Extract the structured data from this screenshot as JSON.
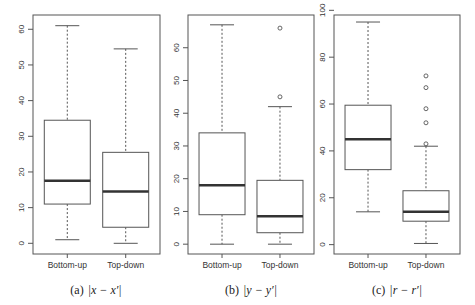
{
  "chart_data": [
    {
      "type": "boxplot",
      "caption_prefix": "(a)",
      "caption_math": "|x − x′|",
      "categories": [
        "Bottom-up",
        "Top-down"
      ],
      "yticks": [
        0,
        10,
        20,
        30,
        40,
        50,
        60
      ],
      "ylim": [
        -3,
        64
      ],
      "xlabel": "",
      "ylabel": "",
      "boxes": [
        {
          "name": "Bottom-up",
          "whisker_low": 1,
          "q1": 11,
          "median": 17.5,
          "q3": 34.5,
          "whisker_high": 61,
          "outliers": []
        },
        {
          "name": "Top-down",
          "whisker_low": 0,
          "q1": 4.5,
          "median": 14.5,
          "q3": 25.5,
          "whisker_high": 54.5,
          "outliers": []
        }
      ]
    },
    {
      "type": "boxplot",
      "caption_prefix": "(b)",
      "caption_math": "|y − y′|",
      "categories": [
        "Bottom-up",
        "Top-down"
      ],
      "yticks": [
        0,
        10,
        20,
        30,
        40,
        50,
        60
      ],
      "ylim": [
        -3,
        70
      ],
      "xlabel": "",
      "ylabel": "",
      "boxes": [
        {
          "name": "Bottom-up",
          "whisker_low": 0,
          "q1": 9,
          "median": 18,
          "q3": 34,
          "whisker_high": 67,
          "outliers": []
        },
        {
          "name": "Top-down",
          "whisker_low": 0,
          "q1": 3.5,
          "median": 8.5,
          "q3": 19.5,
          "whisker_high": 42,
          "outliers": [
            45,
            66
          ]
        }
      ]
    },
    {
      "type": "boxplot",
      "caption_prefix": "(c)",
      "caption_math": "|r − r′|",
      "categories": [
        "Bottom-up",
        "Top-down"
      ],
      "yticks": [
        0,
        20,
        40,
        60,
        80,
        100
      ],
      "ylim": [
        -4,
        98
      ],
      "xlabel": "",
      "ylabel": "",
      "boxes": [
        {
          "name": "Bottom-up",
          "whisker_low": 14,
          "q1": 32,
          "median": 45,
          "q3": 59.5,
          "whisker_high": 95,
          "outliers": []
        },
        {
          "name": "Top-down",
          "whisker_low": 0.5,
          "q1": 10,
          "median": 14,
          "q3": 23,
          "whisker_high": 42,
          "outliers": [
            43,
            52,
            58,
            67,
            72
          ]
        }
      ]
    }
  ]
}
